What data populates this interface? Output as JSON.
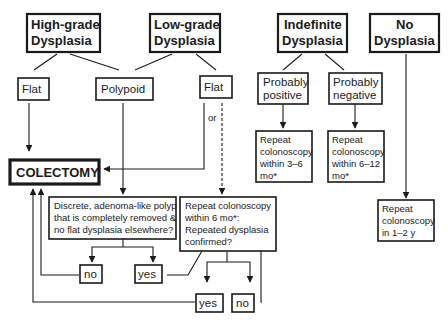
{
  "diagram": {
    "type": "flowchart",
    "topic": "Dysplasia management",
    "nodes": {
      "high_grade": {
        "line1": "High-grade",
        "line2": "Dysplasia"
      },
      "low_grade": {
        "line1": "Low-grade",
        "line2": "Dysplasia"
      },
      "indefinite": {
        "line1": "Indefinite",
        "line2": "Dysplasia"
      },
      "no_dysplasia": {
        "line1": "No",
        "line2": "Dysplasia"
      },
      "flat_high": {
        "label": "Flat"
      },
      "polypoid": {
        "label": "Polypoid"
      },
      "flat_low": {
        "label": "Flat"
      },
      "probably_positive": {
        "line1": "Probably",
        "line2": "positive"
      },
      "probably_negative": {
        "line1": "Probably",
        "line2": "negative"
      },
      "repeat_3_6": {
        "line1": "Repeat",
        "line2": "colonoscopy",
        "line3": "within 3–6",
        "line4": "mo*"
      },
      "repeat_6_12": {
        "line1": "Repeat",
        "line2": "colonoscopy",
        "line3": "within 6–12",
        "line4": "mo*"
      },
      "repeat_1_2y": {
        "line1": "Repeat",
        "line2": "colonoscopy",
        "line3": "in 1–2 y"
      },
      "colectomy": {
        "label": "COLECTOMY"
      },
      "discrete_polyp_question": {
        "line1": "Discrete, adenoma-like polyp",
        "line2": "that is completely removed &",
        "line3": "no flat dysplasia elsewhere?"
      },
      "repeat_6mo_question": {
        "line1": "Repeat colonoscopy",
        "line2": "within 6 mo*:",
        "line3": "Repeated dysplasia",
        "line4": "confirmed?"
      },
      "polyp_no": {
        "label": "no"
      },
      "polyp_yes": {
        "label": "yes"
      },
      "confirmed_yes": {
        "label": "yes"
      },
      "confirmed_no": {
        "label": "no"
      }
    },
    "edge_labels": {
      "or": "or"
    },
    "edges": [
      {
        "from": "High-grade Dysplasia",
        "to": "Flat"
      },
      {
        "from": "High-grade Dysplasia",
        "to": "Polypoid"
      },
      {
        "from": "Low-grade Dysplasia",
        "to": "Polypoid"
      },
      {
        "from": "Low-grade Dysplasia",
        "to": "Flat"
      },
      {
        "from": "Indefinite Dysplasia",
        "to": "Probably positive"
      },
      {
        "from": "Indefinite Dysplasia",
        "to": "Probably negative"
      },
      {
        "from": "Flat (high-grade)",
        "to": "COLECTOMY"
      },
      {
        "from": "Flat (low-grade)",
        "to": "COLECTOMY",
        "label": "or"
      },
      {
        "from": "Flat (low-grade)",
        "to": "Repeat colonoscopy within 6 mo*",
        "style": "dashed"
      },
      {
        "from": "Polypoid",
        "to": "Discrete, adenoma-like polyp question"
      },
      {
        "from": "Probably positive",
        "to": "Repeat colonoscopy within 3–6 mo*"
      },
      {
        "from": "Probably negative",
        "to": "Repeat colonoscopy within 6–12 mo*"
      },
      {
        "from": "No Dysplasia",
        "to": "Repeat colonoscopy in 1–2 y"
      },
      {
        "from": "Discrete polyp question",
        "to": "no"
      },
      {
        "from": "Discrete polyp question",
        "to": "yes"
      },
      {
        "from": "no (polyp)",
        "to": "COLECTOMY"
      },
      {
        "from": "yes (polyp)",
        "to": "Repeat colonoscopy within 6 mo*"
      },
      {
        "from": "Repeated dysplasia confirmed?",
        "to": "yes"
      },
      {
        "from": "Repeated dysplasia confirmed?",
        "to": "no"
      },
      {
        "from": "yes (confirmed)",
        "to": "COLECTOMY"
      },
      {
        "from": "no (confirmed)",
        "to": "Repeat colonoscopy within 6 mo*"
      }
    ]
  }
}
